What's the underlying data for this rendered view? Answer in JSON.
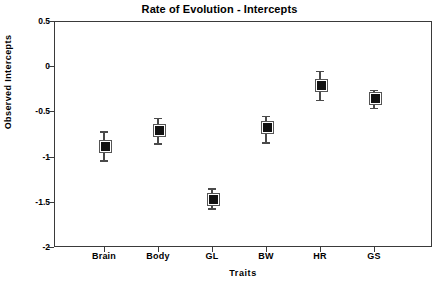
{
  "chart_data": {
    "type": "scatter",
    "title": "Rate of Evolution - Intercepts",
    "xlabel": "Traits",
    "ylabel": "Observed  Intercepts",
    "categories": [
      "Brain",
      "Body",
      "GL",
      "BW",
      "HR",
      "GS"
    ],
    "values": [
      -0.89,
      -0.71,
      -1.48,
      -0.68,
      -0.21,
      -0.36
    ],
    "error_upper": [
      -0.72,
      -0.57,
      -1.35,
      -0.55,
      -0.05,
      -0.26
    ],
    "error_lower": [
      -1.04,
      -0.85,
      -1.57,
      -0.84,
      -0.37,
      -0.46
    ],
    "ylim": [
      -2,
      0.5
    ],
    "ytick_labels": [
      "0.5",
      "0",
      "-0.5",
      "-1",
      "-1.5",
      "-2"
    ],
    "ytick_values": [
      0.5,
      0,
      -0.5,
      -1,
      -1.5,
      -2
    ],
    "grid": false,
    "legend": "none",
    "marker_style": "filled-square",
    "marker_color": "#111111",
    "errorbar_color": "#4a4a4a",
    "axis_color": "#3a3a3a",
    "background_color": "#ffffff",
    "series": [
      {
        "name": "Observed Intercepts",
        "points": [
          {
            "category": "Brain",
            "value": -0.89,
            "upper": -0.72,
            "lower": -1.04
          },
          {
            "category": "Body",
            "value": -0.71,
            "upper": -0.57,
            "lower": -0.85
          },
          {
            "category": "GL",
            "value": -1.48,
            "upper": -1.35,
            "lower": -1.57
          },
          {
            "category": "BW",
            "value": -0.68,
            "upper": -0.55,
            "lower": -0.84
          },
          {
            "category": "HR",
            "value": -0.21,
            "upper": -0.05,
            "lower": -0.37
          },
          {
            "category": "GS",
            "value": -0.36,
            "upper": -0.26,
            "lower": -0.46
          }
        ]
      }
    ]
  }
}
